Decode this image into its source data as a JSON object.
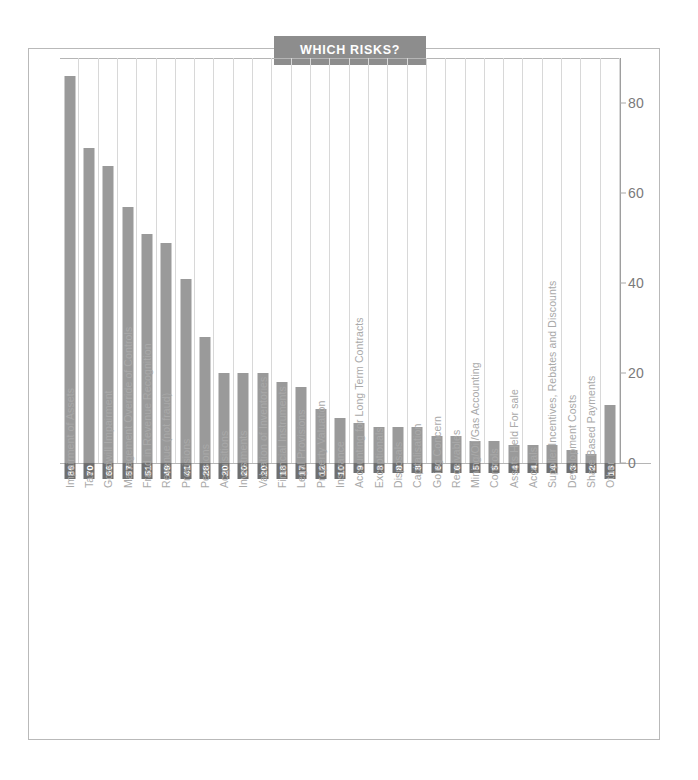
{
  "title": "WHICH RISKS?",
  "colors": {
    "bar": "#9a9a9a",
    "chip_background": "#6f6f6f",
    "chip_text": "#ffffff",
    "title_background": "#8d8d8d",
    "title_text": "#ffffff",
    "gridline": "#d8d8d8",
    "axis": "#9e9e9e",
    "category_text": "#a9a9a9",
    "tick_text": "#7a7a7a",
    "frame": "#b9b9b9",
    "page_background": "#ffffff"
  },
  "chart_data": {
    "type": "bar",
    "title": "WHICH RISKS?",
    "xlabel": "",
    "ylabel": "",
    "ylim": [
      0,
      90
    ],
    "yticks": [
      0,
      20,
      40,
      60,
      80
    ],
    "grid": "vertical",
    "legend": "none",
    "orientation": "vertical",
    "categories": [
      "Impairment of Assets",
      "Tax",
      "Goodwill Impairment",
      "Management Override of Controls",
      "Fraud in Revenue Recognition",
      "Revenue (not fraud)",
      "Provisions",
      "Pensions",
      "Acquisitions",
      "Investments",
      "Valuation of Inventories",
      "Financial Instruments",
      "Legal Provisions",
      "Property Valuation",
      "Insurance",
      "Accounting for Long Term Contracts",
      "Exceptionals",
      "Disposals",
      "Capitalisation",
      "Going Concern",
      "Receivables",
      "Mining/Oil/Gas Accounting",
      "Controls",
      "Assets Held For sale",
      "Accruals",
      "Supplier Incentives, Rebates and Discounts",
      "Development Costs",
      "Share Based Payments",
      "Other"
    ],
    "values": [
      86,
      70,
      66,
      57,
      51,
      49,
      41,
      28,
      20,
      20,
      20,
      18,
      17,
      12,
      10,
      9,
      8,
      8,
      8,
      6,
      6,
      5,
      5,
      4,
      4,
      4,
      3,
      2,
      13
    ]
  }
}
